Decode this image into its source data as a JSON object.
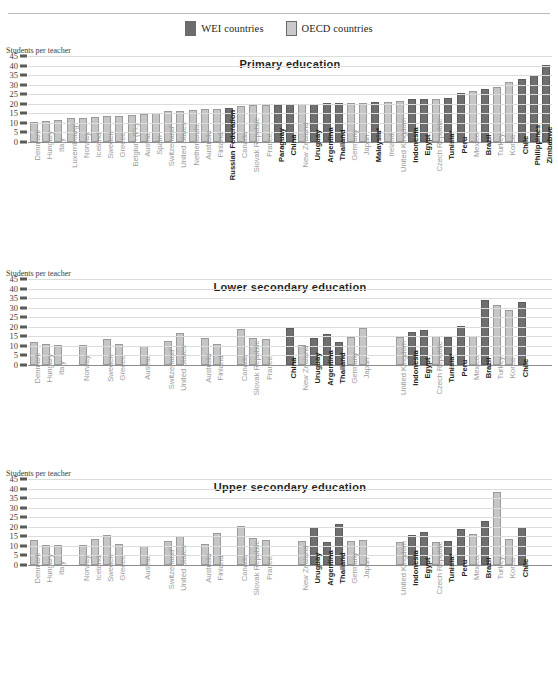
{
  "legend": {
    "items": [
      {
        "label": "WEI countries",
        "key": "wei",
        "color": "#6f6f6f"
      },
      {
        "label": "OECD countries",
        "key": "oecd",
        "color": "#c6c6c6"
      }
    ]
  },
  "axis_title": "Students per teacher",
  "chart_data": [
    {
      "type": "bar",
      "title": "Primary education",
      "xlabel": "",
      "ylabel": "Students per teacher",
      "ylim": [
        0,
        45
      ],
      "yticks": [
        0,
        5,
        10,
        15,
        20,
        25,
        30,
        35,
        40,
        45
      ],
      "grid": true,
      "legend_position": "top-center",
      "categories": [
        "Denmark",
        "Hungary",
        "Italy",
        "Luxembourg°",
        "Norway",
        "Iceland",
        "Sweden",
        "Greece",
        "Belgium (Fl.)",
        "Austria",
        "Spain",
        "Switzerland°",
        "United States",
        "Netherlands",
        "Australia",
        "Finland",
        "Russian Federation",
        "Canada",
        "Slovak Republic",
        "France",
        "Paraguay",
        "China",
        "New Zealand",
        "Uruguay",
        "Argentina",
        "Thailand",
        "Germany",
        "Japan",
        "Malaysia*",
        "Ireland",
        "United Kingdom",
        "Indonesia",
        "Egypt",
        "Czech Republic",
        "Tunisia*",
        "Peru",
        "Mexico",
        "Brazil",
        "Turkey",
        "Korea",
        "Chile",
        "Philippines",
        "Zimbabwe"
      ],
      "groups": [
        "oecd",
        "oecd",
        "oecd",
        "oecd",
        "oecd",
        "oecd",
        "oecd",
        "oecd",
        "oecd",
        "oecd",
        "oecd",
        "oecd",
        "oecd",
        "oecd",
        "oecd",
        "oecd",
        "wei",
        "oecd",
        "oecd",
        "oecd",
        "wei",
        "wei",
        "oecd",
        "wei",
        "wei",
        "wei",
        "oecd",
        "oecd",
        "wei",
        "oecd",
        "oecd",
        "wei",
        "wei",
        "oecd",
        "wei",
        "wei",
        "oecd",
        "wei",
        "oecd",
        "oecd",
        "wei",
        "wei",
        "wei"
      ],
      "values": [
        10.7,
        11.0,
        11.3,
        12.6,
        12.6,
        13.2,
        13.4,
        13.4,
        13.9,
        14.8,
        15.4,
        16.1,
        16.2,
        16.8,
        17.4,
        17.5,
        17.8,
        18.6,
        19.5,
        19.4,
        19.6,
        20.0,
        20.1,
        20.1,
        20.3,
        20.4,
        20.3,
        20.6,
        20.8,
        21.2,
        21.5,
        22.3,
        22.6,
        22.5,
        23.1,
        25.5,
        26.5,
        27.6,
        28.6,
        31.2,
        33.1,
        35.1,
        40.1
      ]
    },
    {
      "type": "bar",
      "title": "Lower secondary education",
      "xlabel": "",
      "ylabel": "Students per teacher",
      "ylim": [
        0,
        45
      ],
      "yticks": [
        0,
        5,
        10,
        15,
        20,
        25,
        30,
        35,
        40,
        45
      ],
      "grid": true,
      "categories": [
        "Denmark",
        "Hungary",
        "Italy",
        "",
        "Norway",
        "",
        "Sweden",
        "Greece",
        "",
        "Austria",
        "",
        "Switzerland°",
        "United States",
        "",
        "Australia",
        "Finland",
        "",
        "Canada",
        "Slovak Republic",
        "France",
        "",
        "China",
        "New Zealand",
        "Uruguay",
        "Argentina",
        "Thailand",
        "Germany",
        "Japan",
        "",
        "",
        "United Kingdom",
        "Indonesia",
        "Egypt",
        "Czech Republic",
        "Tunisia*",
        "Peru",
        "Mexico",
        "Brazil",
        "Turkey",
        "Korea",
        "Chile",
        "",
        ""
      ],
      "groups": [
        "oecd",
        "oecd",
        "oecd",
        "none",
        "oecd",
        "none",
        "oecd",
        "oecd",
        "none",
        "oecd",
        "none",
        "oecd",
        "oecd",
        "none",
        "oecd",
        "oecd",
        "none",
        "oecd",
        "oecd",
        "oecd",
        "none",
        "wei",
        "oecd",
        "wei",
        "wei",
        "wei",
        "oecd",
        "oecd",
        "none",
        "none",
        "oecd",
        "wei",
        "wei",
        "oecd",
        "wei",
        "wei",
        "oecd",
        "wei",
        "oecd",
        "oecd",
        "wei",
        "none",
        "none"
      ],
      "values": [
        12.1,
        11.2,
        10.6,
        0,
        10.7,
        0,
        13.5,
        11.1,
        0,
        10.1,
        0,
        12.4,
        17.0,
        0,
        14.1,
        11.0,
        0,
        19.0,
        13.9,
        13.4,
        0,
        19.4,
        10.3,
        14.2,
        16.1,
        11.8,
        14.4,
        19.5,
        0,
        0,
        14.9,
        17.2,
        18.2,
        15.2,
        14.8,
        20.2,
        15.3,
        33.9,
        31.5,
        28.9,
        32.9,
        0,
        0
      ]
    },
    {
      "type": "bar",
      "title": "Upper secondary education",
      "xlabel": "",
      "ylabel": "Students per teacher",
      "ylim": [
        0,
        45
      ],
      "yticks": [
        0,
        5,
        10,
        15,
        20,
        25,
        30,
        35,
        40,
        45
      ],
      "grid": true,
      "categories": [
        "Denmark",
        "Hungary",
        "Italy",
        "",
        "Norway",
        "Iceland",
        "Sweden",
        "Greece",
        "",
        "Austria",
        "",
        "Switzerland°",
        "United States",
        "",
        "Australia",
        "Finland",
        "",
        "Canada",
        "Slovak Republic",
        "France",
        "",
        "",
        "New Zealand",
        "Uruguay",
        "Argentina",
        "Thailand",
        "Germany",
        "Japan",
        "",
        "",
        "United Kingdom",
        "Indonesia",
        "Egypt",
        "Czech Republic",
        "Tunisia*",
        "Peru",
        "Mexico",
        "Brazil",
        "Turkey",
        "Korea",
        "Chile",
        "",
        ""
      ],
      "groups": [
        "oecd",
        "oecd",
        "oecd",
        "none",
        "oecd",
        "oecd",
        "oecd",
        "oecd",
        "none",
        "oecd",
        "none",
        "oecd",
        "oecd",
        "none",
        "oecd",
        "oecd",
        "none",
        "oecd",
        "oecd",
        "oecd",
        "none",
        "none",
        "oecd",
        "wei",
        "wei",
        "wei",
        "oecd",
        "oecd",
        "none",
        "none",
        "oecd",
        "wei",
        "wei",
        "oecd",
        "wei",
        "wei",
        "oecd",
        "wei",
        "oecd",
        "oecd",
        "wei",
        "none",
        "none"
      ],
      "values": [
        13.3,
        10.6,
        10.5,
        0,
        10.3,
        13.6,
        15.7,
        10.8,
        0,
        10.2,
        0,
        12.5,
        15.0,
        0,
        10.8,
        16.8,
        0,
        20.4,
        14.0,
        12.9,
        0,
        0,
        12.8,
        19.7,
        12.1,
        21.6,
        12.6,
        13.1,
        0,
        0,
        12.3,
        15.9,
        17.5,
        12.2,
        12.5,
        18.9,
        16.1,
        23.1,
        38.0,
        13.8,
        20.0,
        0,
        0
      ]
    }
  ]
}
